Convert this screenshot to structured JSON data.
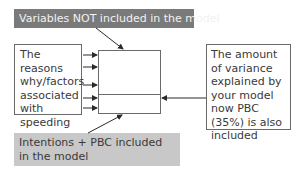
{
  "diagram": {
    "top_label": "Variables NOT included in the model",
    "left_box": "The reasons why/factors associated with speeding",
    "right_box": "The amount of variance explained by your model now PBC (35%) is also included",
    "bottom_label": "Intentions + PBC included in the model",
    "center_box": {
      "upper_section": "",
      "lower_section": ""
    },
    "colors": {
      "top_label_bg": "#7a7a7a",
      "bottom_label_bg": "#c8c8c8",
      "border": "#6a6a6a",
      "arrow": "#2a2a2a"
    },
    "arrows": [
      {
        "from": "left-box",
        "to": "center-box",
        "count": 5
      },
      {
        "from": "top-label",
        "to": "center-box-top"
      },
      {
        "from": "bottom-label",
        "to": "center-box-bottom"
      },
      {
        "from": "right-box",
        "to": "center-box-lower-section"
      }
    ]
  }
}
